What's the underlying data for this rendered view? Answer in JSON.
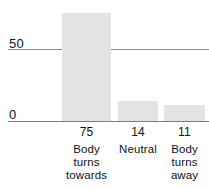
{
  "chart_data": {
    "type": "bar",
    "title": "",
    "subtitle": "",
    "xlabel": "",
    "ylabel": "",
    "categories": [
      "Body turns towards",
      "Neutral",
      "Body turns away"
    ],
    "values": [
      75,
      14,
      11
    ],
    "series": [
      {
        "name": "",
        "values": [
          75,
          14,
          11
        ]
      }
    ],
    "ylim": [
      0,
      80
    ],
    "yticks": [
      0,
      50
    ],
    "ytick_labels": [
      "0",
      "50"
    ],
    "grid": true,
    "grid_axis": "y",
    "legend": false,
    "legend_position": "none",
    "value_labels_shown": true,
    "value_labels": [
      "75",
      "14",
      "11"
    ],
    "bar_color": "#e3e3e3",
    "axis_color": "#8c8c8c",
    "text_color": "#121212",
    "background": "#ffffff"
  },
  "axis": {
    "y_tick_50": "50",
    "y_tick_0": "0"
  },
  "bars": [
    {
      "value_label": "75",
      "category_label": "Body turns towards"
    },
    {
      "value_label": "14",
      "category_label": "Neutral"
    },
    {
      "value_label": "11",
      "category_label": "Body turns away"
    }
  ]
}
